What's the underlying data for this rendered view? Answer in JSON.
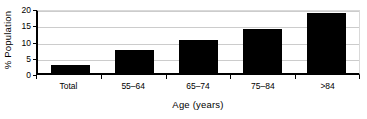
{
  "chart_data": {
    "type": "bar",
    "title": "",
    "subtitle": "",
    "xlabel": "Age (years)",
    "ylabel": "% Population",
    "categories": [
      "Total",
      "55–64",
      "65–74",
      "75–84",
      ">84"
    ],
    "values": [
      2.5,
      7.2,
      10.2,
      13.4,
      18.5
    ],
    "series": [
      {
        "name": "% Population",
        "values": [
          2.5,
          7.2,
          10.2,
          13.4,
          18.5
        ]
      }
    ],
    "ylim": [
      0,
      20
    ],
    "xlim_categories": 5,
    "yticks": [
      0,
      5,
      10,
      15,
      20
    ],
    "ytick_labels": [
      "0",
      "5",
      "10",
      "15",
      "20"
    ],
    "grid": "horizontal",
    "grid_color": "#cccccc",
    "legend": "none",
    "bar_color": "#000000",
    "axis_color": "#000000",
    "background_color": "#ffffff",
    "annotations": []
  },
  "axes": {
    "y_title": "% Population",
    "x_title": "Age (years)"
  }
}
